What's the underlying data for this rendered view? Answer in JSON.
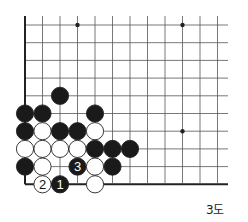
{
  "diagram": {
    "caption": "3도",
    "grid": {
      "origin_x": 25,
      "origin_y": 25,
      "spacing_x": 17.5,
      "spacing_y": 17.7,
      "cols": 12,
      "rows": 10,
      "line_extend_right": 228,
      "edges": [
        "left",
        "bottom"
      ],
      "line_color": "#555555",
      "edge_color": "#222222"
    },
    "hoshi": [
      {
        "col": 3,
        "row": 0
      },
      {
        "col": 9,
        "row": 0
      },
      {
        "col": 9,
        "row": 6
      }
    ],
    "stones": [
      {
        "col": 2,
        "row": 4,
        "color": "black"
      },
      {
        "col": 0,
        "row": 5,
        "color": "black"
      },
      {
        "col": 1,
        "row": 5,
        "color": "black"
      },
      {
        "col": 4,
        "row": 5,
        "color": "black"
      },
      {
        "col": 0,
        "row": 6,
        "color": "black"
      },
      {
        "col": 1,
        "row": 6,
        "color": "white"
      },
      {
        "col": 2,
        "row": 6,
        "color": "black"
      },
      {
        "col": 3,
        "row": 6,
        "color": "black"
      },
      {
        "col": 4,
        "row": 6,
        "color": "white"
      },
      {
        "col": 0,
        "row": 7,
        "color": "white"
      },
      {
        "col": 1,
        "row": 7,
        "color": "white"
      },
      {
        "col": 2,
        "row": 7,
        "color": "white"
      },
      {
        "col": 3,
        "row": 7,
        "color": "white"
      },
      {
        "col": 4,
        "row": 7,
        "color": "black"
      },
      {
        "col": 5,
        "row": 7,
        "color": "black"
      },
      {
        "col": 6,
        "row": 7,
        "color": "black"
      },
      {
        "col": 0,
        "row": 8,
        "color": "black"
      },
      {
        "col": 1,
        "row": 8,
        "color": "white"
      },
      {
        "col": 3,
        "row": 8,
        "color": "black",
        "label": "3"
      },
      {
        "col": 4,
        "row": 8,
        "color": "white"
      },
      {
        "col": 5,
        "row": 8,
        "color": "black"
      },
      {
        "col": 1,
        "row": 9,
        "color": "white",
        "label": "2"
      },
      {
        "col": 2,
        "row": 9,
        "color": "black",
        "label": "1"
      },
      {
        "col": 4,
        "row": 9,
        "color": "white"
      }
    ],
    "colors": {
      "black_stone": "#1a1a1a",
      "white_stone": "#ffffff",
      "stone_outline": "#222222"
    }
  }
}
